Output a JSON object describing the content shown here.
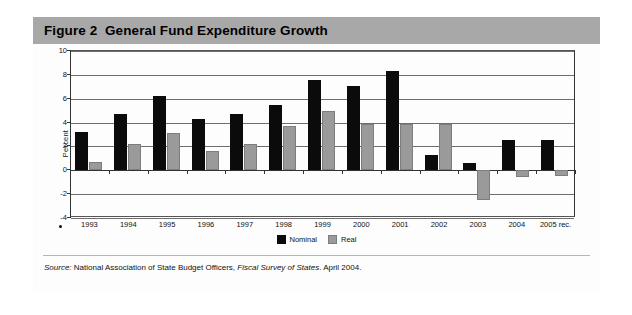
{
  "figure": {
    "title": "Figure 2  General Fund Expenditure Growth",
    "source_label": "Source:",
    "source_org": "National Association of State Budget Officers,",
    "source_publication": "Fiscal Survey of States",
    "source_date": ". April 2004."
  },
  "legend": {
    "items": [
      {
        "label": "Nominal",
        "color": "#0b0b0b"
      },
      {
        "label": "Real",
        "color": "#9a9a9a"
      }
    ]
  },
  "chart_data": {
    "type": "bar",
    "title": "Figure 2  General Fund Expenditure Growth",
    "xlabel": "",
    "ylabel": "Percent",
    "ylim": [
      -4,
      10
    ],
    "yticks": [
      10,
      8,
      6,
      4,
      2,
      0,
      -2,
      -4
    ],
    "ytick_labels": [
      "10",
      "8",
      "6",
      "4",
      "2",
      "0",
      "-2",
      "-4"
    ],
    "grid": true,
    "legend_position": "bottom-center",
    "categories": [
      "1993",
      "1994",
      "1995",
      "1996",
      "1997",
      "1998",
      "1999",
      "2000",
      "2001",
      "2002",
      "2003",
      "2004",
      "2005 rec."
    ],
    "series": [
      {
        "name": "Nominal",
        "color": "#0b0b0b",
        "values": [
          3.2,
          4.7,
          6.2,
          4.3,
          4.7,
          5.5,
          7.6,
          7.1,
          8.3,
          1.3,
          0.6,
          2.5,
          2.5
        ]
      },
      {
        "name": "Real",
        "color": "#9a9a9a",
        "values": [
          0.7,
          2.2,
          3.1,
          1.6,
          2.2,
          3.7,
          5.0,
          3.9,
          3.9,
          3.9,
          -2.5,
          -0.6,
          -0.5
        ]
      }
    ]
  }
}
